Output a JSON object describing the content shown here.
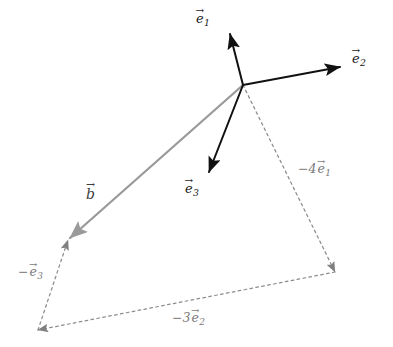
{
  "figure": {
    "type": "vector-decomposition-diagram",
    "background_color": "#ffffff",
    "width": 393,
    "height": 347,
    "origin": {
      "x": 243,
      "y": 85
    }
  },
  "colors": {
    "basis_vector": "#111111",
    "b_vector": "#9a9a9a",
    "component_dashed": "#8c8c8c",
    "basis_label": "#1a1a1a",
    "component_label": "#7a7a7a"
  },
  "vectors": {
    "e1": {
      "name": "e1",
      "symbol": "e",
      "subscript": "1",
      "arrow_accent": "→",
      "label": "e1",
      "style": "solid",
      "color": "#111111",
      "from": {
        "x": 243,
        "y": 85
      },
      "to": {
        "x": 229,
        "y": 32
      },
      "label_pos": {
        "x": 196,
        "y": 12
      }
    },
    "e2": {
      "name": "e2",
      "symbol": "e",
      "subscript": "2",
      "arrow_accent": "→",
      "label": "e2",
      "style": "solid",
      "color": "#111111",
      "from": {
        "x": 243,
        "y": 85
      },
      "to": {
        "x": 342,
        "y": 66
      },
      "label_pos": {
        "x": 352,
        "y": 52
      }
    },
    "e3": {
      "name": "e3",
      "symbol": "e",
      "subscript": "3",
      "arrow_accent": "→",
      "label": "e3",
      "style": "solid",
      "color": "#111111",
      "from": {
        "x": 243,
        "y": 85
      },
      "to": {
        "x": 207,
        "y": 175
      },
      "label_pos": {
        "x": 185,
        "y": 182
      }
    },
    "b": {
      "name": "b",
      "symbol": "b",
      "subscript": "",
      "arrow_accent": "→",
      "label": "b",
      "style": "solid",
      "color": "#9a9a9a",
      "from": {
        "x": 243,
        "y": 85
      },
      "to": {
        "x": 68,
        "y": 240
      },
      "label_pos": {
        "x": 86,
        "y": 187
      }
    }
  },
  "components": {
    "c1": {
      "name": "minus-4-e1",
      "coefficient": "−4",
      "symbol": "e",
      "subscript": "1",
      "arrow_accent": "→",
      "style": "dashed",
      "color": "#8c8c8c",
      "from": {
        "x": 243,
        "y": 85
      },
      "to": {
        "x": 335,
        "y": 272
      },
      "label_pos": {
        "x": 298,
        "y": 163
      }
    },
    "c2": {
      "name": "minus-3-e2",
      "coefficient": "−3",
      "symbol": "e",
      "subscript": "2",
      "arrow_accent": "→",
      "style": "dashed",
      "color": "#8c8c8c",
      "from": {
        "x": 335,
        "y": 272
      },
      "to": {
        "x": 38,
        "y": 330
      },
      "label_pos": {
        "x": 172,
        "y": 312
      }
    },
    "c3": {
      "name": "minus-e3",
      "coefficient": "−",
      "symbol": "e",
      "subscript": "3",
      "arrow_accent": "→",
      "style": "dashed",
      "color": "#8c8c8c",
      "from": {
        "x": 38,
        "y": 330
      },
      "to": {
        "x": 68,
        "y": 240
      },
      "label_pos": {
        "x": 18,
        "y": 266
      }
    }
  }
}
